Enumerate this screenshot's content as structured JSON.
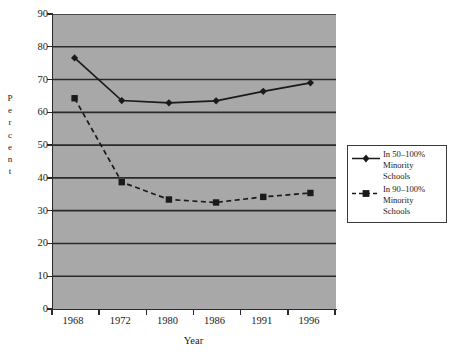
{
  "chart_data": {
    "type": "line",
    "title": "",
    "subtitle": "",
    "xlabel": "Year",
    "ylabel": "Percent",
    "categories": [
      "1968",
      "1972",
      "1980",
      "1986",
      "1991",
      "1996"
    ],
    "x": [
      1968,
      1972,
      1980,
      1986,
      1991,
      1996
    ],
    "ylim": [
      0,
      90
    ],
    "ytick_labels": [
      "90",
      "80",
      "70",
      "60",
      "50",
      "40",
      "30",
      "20",
      "10",
      "0"
    ],
    "yticks": [
      90,
      80,
      70,
      60,
      50,
      40,
      30,
      20,
      10,
      0
    ],
    "grid": true,
    "grid_axis": "y",
    "legend_position": "right",
    "plot_background": "#a8a8a8",
    "series": [
      {
        "name": "In 50–100% Minority Schools",
        "legend_label": "In 50–100%\nMinority\nSchools",
        "marker": "diamond",
        "line_style": "solid",
        "color": "#1a1a1a",
        "values": [
          76.6,
          63.6,
          62.9,
          63.5,
          66.4,
          69.0
        ]
      },
      {
        "name": "In 90–100% Minority Schools",
        "legend_label": "In 90–100%\nMinority\nSchools",
        "marker": "square",
        "line_style": "dashed",
        "color": "#1a1a1a",
        "values": [
          64.3,
          38.7,
          33.4,
          32.5,
          34.2,
          35.4
        ]
      }
    ]
  },
  "axes": {
    "y_title_letters": [
      "P",
      "e",
      "r",
      "c",
      "e",
      "n",
      "t"
    ],
    "x_title": "Year"
  },
  "colors": {
    "plot_bg": "#a8a8a8",
    "grid_line": "#2a2a2a",
    "series_line": "#1a1a1a",
    "axis": "#2a2a2a",
    "legend_border": "#3a3a3a",
    "page_bg": "#ffffff"
  }
}
